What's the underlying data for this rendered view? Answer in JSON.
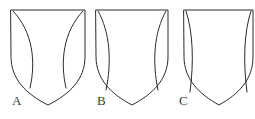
{
  "figure": {
    "background_color": "#ffffff",
    "stroke_color": "#2b2b2b",
    "label_color": "#3a3a3a",
    "width": 255,
    "height": 119
  },
  "shields": [
    {
      "id": "A",
      "label": "A",
      "label_x": 12,
      "label_y": 105,
      "left": 11,
      "right": 85,
      "top": 10,
      "point_x": 48,
      "point_y": 105,
      "outline_path": "M 11 10 L 85 10 L 85 57 C 85 79 70 94 48 105 C 26 94 11 79 11 57 Z",
      "flanks": [
        {
          "name": "left-flank-arc",
          "path": "M 13 11 C 33 32 36 62 30 88",
          "description": "left inner arc bulging toward center"
        },
        {
          "name": "right-flank-arc",
          "path": "M 83 11 C 63 32 60 62 66 88",
          "description": "right inner arc bulging toward center"
        }
      ]
    },
    {
      "id": "B",
      "label": "B",
      "label_x": 97,
      "label_y": 105,
      "left": 96,
      "right": 168,
      "top": 10,
      "point_x": 132,
      "point_y": 105,
      "outline_path": "M 96 10 L 168 10 L 168 57 C 168 79 153 94 132 105 C 111 94 96 79 96 57 Z",
      "flanks": [
        {
          "name": "left-flank-arc",
          "path": "M 98 11 C 110 32 112 62 106 90",
          "description": "narrow left inner arc"
        },
        {
          "name": "right-flank-arc",
          "path": "M 166 11 C 154 32 152 62 158 90",
          "description": "narrow right inner arc"
        }
      ]
    },
    {
      "id": "C",
      "label": "C",
      "label_x": 179,
      "label_y": 105,
      "left": 184,
      "right": 253,
      "top": 10,
      "point_x": 219,
      "point_y": 105,
      "outline_path": "M 184 10 L 253 10 L 253 57 C 253 79 239 94 219 105 C 199 94 184 79 184 57 Z",
      "flanks": [
        {
          "name": "left-flank-arc",
          "path": "M 186 11 C 193 32 194 62 190 92",
          "description": "very narrow left inner arc hugging edge"
        },
        {
          "name": "right-flank-arc",
          "path": "M 251 11 C 244 32 243 62 247 92",
          "description": "very narrow right inner arc hugging edge"
        }
      ]
    }
  ]
}
